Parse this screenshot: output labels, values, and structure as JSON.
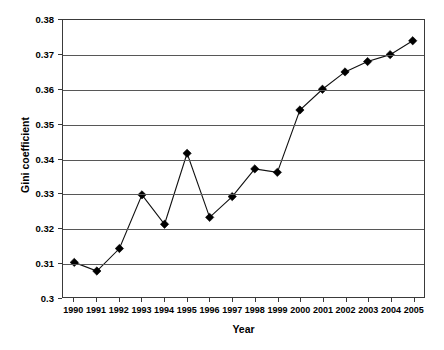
{
  "chart_data": {
    "type": "line",
    "title": "",
    "xlabel": "Year",
    "ylabel": "Gini coefficient",
    "categories": [
      "1990",
      "1991",
      "1992",
      "1993",
      "1994",
      "1995",
      "1996",
      "1997",
      "1998",
      "1999",
      "2000",
      "2001",
      "2002",
      "2003",
      "2004",
      "2005"
    ],
    "values": [
      0.31,
      0.3075,
      0.314,
      0.3295,
      0.321,
      0.3415,
      0.323,
      0.329,
      0.337,
      0.336,
      0.354,
      0.36,
      0.365,
      0.368,
      0.37,
      0.374
    ],
    "series": [
      {
        "name": "Gini coefficient",
        "values": [
          0.31,
          0.3075,
          0.314,
          0.3295,
          0.321,
          0.3415,
          0.323,
          0.329,
          0.337,
          0.336,
          0.354,
          0.36,
          0.365,
          0.368,
          0.37,
          0.374
        ]
      }
    ],
    "ylim": [
      0.3,
      0.38
    ],
    "ytick_labels": [
      "0.38",
      "0.37",
      "0.36",
      "0.35",
      "0.34",
      "0.33",
      "0.32",
      "0.31",
      "0.3"
    ],
    "ytick_values": [
      0.38,
      0.37,
      0.36,
      0.35,
      0.34,
      0.33,
      0.32,
      0.31,
      0.3
    ],
    "xtick_labels": [
      "1990",
      "1991",
      "1992",
      "1993",
      "1994",
      "1995",
      "1996",
      "1997",
      "1998",
      "1999",
      "2000",
      "2001",
      "2002",
      "2003",
      "2004",
      "2005"
    ],
    "grid": "horizontal",
    "legend": "none",
    "marker": "diamond",
    "line_color": "#111111",
    "marker_color": "#000000",
    "grid_color": "#575757",
    "axis_color": "#3a3a3a",
    "background_color": "#ffffff"
  }
}
